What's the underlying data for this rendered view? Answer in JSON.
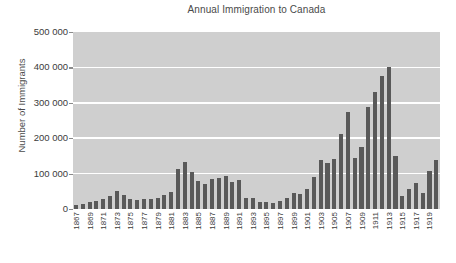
{
  "chart_data": {
    "type": "bar",
    "title": "Annual Immigration to Canada",
    "xlabel": "",
    "ylabel": "Number of Immigrants",
    "ylim": [
      0,
      500000
    ],
    "grid": true,
    "legend": "none",
    "ytick_labels": [
      "500 000",
      "400 000",
      "300 000",
      "200 000",
      "100 000",
      "0"
    ],
    "ytick_values": [
      500000,
      400000,
      300000,
      200000,
      100000,
      0
    ],
    "xtick_labels": [
      "1867",
      "1869",
      "1871",
      "1873",
      "1875",
      "1877",
      "1879",
      "1881",
      "1883",
      "1885",
      "1887",
      "1889",
      "1891",
      "1893",
      "1895",
      "1897",
      "1899",
      "1901",
      "1903",
      "1905",
      "1907",
      "1909",
      "1911",
      "1913",
      "1915",
      "1917",
      "1919"
    ],
    "categories": [
      "1867",
      "1868",
      "1869",
      "1870",
      "1871",
      "1872",
      "1873",
      "1874",
      "1875",
      "1876",
      "1877",
      "1878",
      "1879",
      "1880",
      "1881",
      "1882",
      "1883",
      "1884",
      "1885",
      "1886",
      "1887",
      "1888",
      "1889",
      "1890",
      "1891",
      "1892",
      "1893",
      "1894",
      "1895",
      "1896",
      "1897",
      "1898",
      "1899",
      "1900",
      "1901",
      "1902",
      "1903",
      "1904",
      "1905",
      "1906",
      "1907",
      "1908",
      "1909",
      "1910",
      "1911",
      "1912",
      "1913",
      "1914",
      "1915",
      "1916",
      "1917",
      "1918",
      "1919",
      "1920"
    ],
    "values": [
      10000,
      13000,
      19000,
      24000,
      28000,
      37000,
      50000,
      40000,
      27000,
      26000,
      27000,
      29000,
      32000,
      39000,
      48000,
      112000,
      133000,
      104000,
      80000,
      70000,
      85000,
      89000,
      92000,
      76000,
      83000,
      31000,
      30000,
      21000,
      19000,
      17000,
      22000,
      32000,
      45000,
      42000,
      56000,
      90000,
      139000,
      131000,
      141000,
      212000,
      273000,
      144000,
      174000,
      287000,
      331000,
      376000,
      401000,
      151000,
      37000,
      56000,
      73000,
      44000,
      108000,
      139000
    ],
    "bar_color": "#595959",
    "plot_background": "#cfcfcf",
    "gridline_color": "#ffffff"
  }
}
